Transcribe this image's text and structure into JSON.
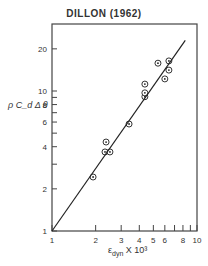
{
  "chart_data": {
    "type": "scatter",
    "title": "DILLON (1962)",
    "xlabel": "ε_dyn X 10³",
    "ylabel": "ρ C_d Δ θ",
    "xscale": "log",
    "yscale": "log",
    "xlim": [
      1,
      10
    ],
    "ylim": [
      1,
      30
    ],
    "x_ticks": [
      1,
      2,
      3,
      4,
      5,
      6,
      7,
      8,
      9,
      10
    ],
    "x_tick_labels": [
      "1",
      "2",
      "3",
      "4",
      "5",
      "6",
      "",
      "8",
      "",
      "10"
    ],
    "y_ticks": [
      1,
      2,
      3,
      4,
      5,
      6,
      7,
      8,
      9,
      10,
      20
    ],
    "y_tick_labels": [
      "1",
      "2",
      "",
      "4",
      "",
      "6",
      "",
      "8",
      "",
      "10",
      "20"
    ],
    "grid": false,
    "legend": null,
    "series": [
      {
        "name": "observations",
        "marker": "circled-dot",
        "x": [
          1.92,
          2.32,
          2.51,
          2.36,
          3.4,
          4.37,
          4.37,
          4.37,
          5.38,
          6.0,
          6.4,
          6.4
        ],
        "y": [
          2.43,
          3.67,
          3.67,
          4.32,
          5.81,
          9.1,
          9.7,
          11.2,
          15.8,
          12.2,
          14.1,
          16.4
        ]
      },
      {
        "name": "fit line",
        "type": "line",
        "x": [
          1,
          8.3
        ],
        "y": [
          1,
          23
        ]
      }
    ]
  },
  "labels": {
    "title": "DILLON (1962)",
    "ylabel": "ρ C_d Δ θ",
    "xlabel_main": "ε",
    "xlabel_sub": "dyn",
    "xlabel_suffix": " X 10³"
  }
}
